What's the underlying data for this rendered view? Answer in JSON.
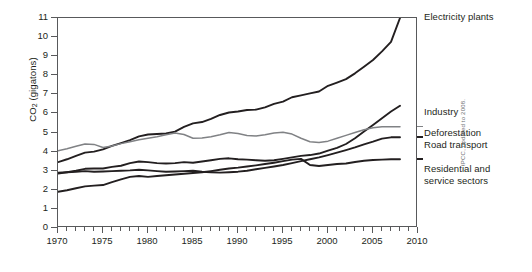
{
  "chart_data": {
    "type": "line",
    "title": "",
    "xlabel": "",
    "ylabel": "CO2 (gigatons)",
    "ylabel_main": "CO",
    "ylabel_sub": "2",
    "ylabel_unit": " (gigatons)",
    "xlim": [
      1970,
      2010
    ],
    "ylim": [
      0,
      11
    ],
    "grid": false,
    "legend_position": "right-inline-labels",
    "xticks": [
      1970,
      1975,
      1980,
      1985,
      1990,
      1995,
      2000,
      2005,
      2010
    ],
    "xtick_labels": [
      "1970",
      "1975",
      "1980",
      "1985",
      "1990",
      "1995",
      "2000",
      "2005",
      "2010"
    ],
    "xminor_step": 1,
    "yticks": [
      0,
      1,
      2,
      3,
      4,
      5,
      6,
      7,
      8,
      9,
      10,
      11
    ],
    "ytick_labels": [
      "0",
      "1",
      "2",
      "3",
      "4",
      "5",
      "6",
      "7",
      "8",
      "9",
      "10",
      "11"
    ],
    "x": [
      1970,
      1971,
      1972,
      1973,
      1974,
      1975,
      1976,
      1977,
      1978,
      1979,
      1980,
      1981,
      1982,
      1983,
      1984,
      1985,
      1986,
      1987,
      1988,
      1989,
      1990,
      1991,
      1992,
      1993,
      1994,
      1995,
      1996,
      1997,
      1998,
      1999,
      2000,
      2001,
      2002,
      2003,
      2004,
      2005,
      2006,
      2007,
      2008
    ],
    "series": [
      {
        "name": "Electricity plants",
        "color": "#231f20",
        "width": 1.9,
        "label_value_start": 3.45,
        "label_value_end": 11.0,
        "values": [
          3.45,
          3.6,
          3.78,
          3.95,
          4.0,
          4.12,
          4.3,
          4.45,
          4.6,
          4.8,
          4.9,
          4.92,
          4.95,
          5.05,
          5.3,
          5.48,
          5.55,
          5.72,
          5.92,
          6.05,
          6.1,
          6.18,
          6.2,
          6.32,
          6.5,
          6.62,
          6.85,
          6.95,
          7.05,
          7.15,
          7.45,
          7.62,
          7.8,
          8.1,
          8.45,
          8.8,
          9.25,
          9.75,
          11.0
        ]
      },
      {
        "name": "Industry",
        "color": "#231f20",
        "width": 1.9,
        "label_value_start": 2.85,
        "label_value_end": 6.4,
        "values": [
          2.85,
          2.92,
          3.0,
          3.1,
          3.12,
          3.12,
          3.2,
          3.26,
          3.4,
          3.48,
          3.45,
          3.4,
          3.38,
          3.4,
          3.45,
          3.42,
          3.48,
          3.55,
          3.62,
          3.65,
          3.6,
          3.58,
          3.55,
          3.52,
          3.55,
          3.62,
          3.7,
          3.78,
          3.82,
          3.9,
          4.05,
          4.2,
          4.4,
          4.7,
          5.05,
          5.4,
          5.75,
          6.1,
          6.4
        ]
      },
      {
        "name": "Deforestation",
        "color": "#808285",
        "width": 1.5,
        "label_value_start": 4.05,
        "label_value_end": 5.3,
        "values": [
          4.05,
          4.15,
          4.28,
          4.4,
          4.38,
          4.22,
          4.3,
          4.42,
          4.52,
          4.62,
          4.7,
          4.78,
          4.88,
          4.98,
          4.9,
          4.7,
          4.72,
          4.78,
          4.88,
          5.0,
          4.95,
          4.85,
          4.82,
          4.88,
          4.98,
          5.02,
          4.92,
          4.7,
          4.52,
          4.48,
          4.55,
          4.7,
          4.85,
          5.0,
          5.15,
          5.25,
          5.3,
          5.3,
          5.3
        ]
      },
      {
        "name": "Road transport",
        "color": "#231f20",
        "width": 1.9,
        "label_value_start": 2.9,
        "label_value_end": 4.75,
        "values": [
          2.9,
          2.92,
          2.95,
          2.98,
          2.95,
          2.96,
          2.98,
          3.0,
          3.02,
          3.05,
          3.02,
          2.98,
          2.95,
          2.96,
          2.98,
          3.0,
          2.95,
          2.92,
          2.9,
          2.92,
          2.95,
          3.0,
          3.08,
          3.15,
          3.22,
          3.3,
          3.4,
          3.5,
          3.6,
          3.7,
          3.82,
          3.95,
          4.08,
          4.22,
          4.38,
          4.52,
          4.68,
          4.75,
          4.75
        ]
      },
      {
        "name": "Residential and service sectors",
        "color": "#231f20",
        "width": 1.9,
        "label_value_start": 1.9,
        "label_value_end": 3.6,
        "values": [
          1.9,
          1.98,
          2.08,
          2.18,
          2.22,
          2.25,
          2.4,
          2.55,
          2.68,
          2.72,
          2.68,
          2.72,
          2.76,
          2.8,
          2.84,
          2.88,
          2.92,
          2.98,
          3.05,
          3.12,
          3.16,
          3.22,
          3.28,
          3.35,
          3.42,
          3.5,
          3.58,
          3.62,
          3.3,
          3.25,
          3.3,
          3.35,
          3.38,
          3.46,
          3.52,
          3.56,
          3.58,
          3.6,
          3.6
        ]
      }
    ],
    "annotations": [
      {
        "name": "electricity-plants-label",
        "text": "Electricity plants",
        "lines": [
          "Electricity plants"
        ]
      },
      {
        "name": "industry-label",
        "text": "Industry",
        "lines": [
          "Industry"
        ]
      },
      {
        "name": "deforestation-label",
        "text": "Deforestation",
        "lines": [
          "Deforestation"
        ]
      },
      {
        "name": "road-transport-label",
        "text": "Road transport",
        "lines": [
          "Road transport"
        ]
      },
      {
        "name": "residential-label",
        "text": "Residential and service sectors",
        "lines": [
          "Residential and",
          "service sectors"
        ]
      }
    ],
    "source": "IPCC, updated to 2008."
  },
  "labels": {
    "electricity_plants": "Electricity plants",
    "industry": "Industry",
    "deforestation": "Deforestation",
    "road_transport": "Road transport",
    "residential_line1": "Residential and",
    "residential_line2": "service sectors"
  },
  "axis": {
    "y_title_main": "CO",
    "y_title_sub": "2",
    "y_title_unit": " (gigatons)"
  },
  "source": {
    "credit": "IPCC, updated to 2008."
  }
}
